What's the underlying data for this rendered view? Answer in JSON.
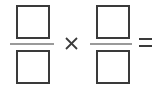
{
  "expression": {
    "type": "fraction-multiplication-blank",
    "left_fraction": {
      "numerator": "",
      "denominator": ""
    },
    "operator": "multiply",
    "right_fraction": {
      "numerator": "",
      "denominator": ""
    },
    "result_sign": "equals"
  },
  "colors": {
    "box_border": "#3a3a3a",
    "fraction_bar": "#9a9a9a",
    "operator": "#3a3a3a"
  }
}
